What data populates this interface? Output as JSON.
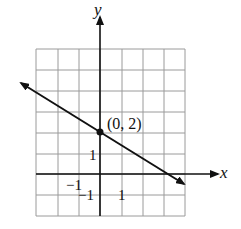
{
  "chart_data": {
    "type": "line",
    "title": "",
    "xlabel": "x",
    "ylabel": "y",
    "xlim": [
      -3,
      4
    ],
    "ylim": [
      -2,
      6
    ],
    "grid": true,
    "grid_spacing": 1,
    "series": [
      {
        "name": "line",
        "x": [
          -3,
          4
        ],
        "y": [
          4,
          -0.67
        ],
        "slope": -0.667,
        "y_intercept": 2,
        "arrows_both_ends": true
      }
    ],
    "annotations": [
      {
        "text": "(0, 2)",
        "x": 0,
        "y": 2,
        "marker": "dot"
      }
    ],
    "tick_labels": {
      "x": [
        {
          "value": -1,
          "text": "−1"
        },
        {
          "value": 1,
          "text": "1"
        }
      ],
      "y": [
        {
          "value": 1,
          "text": "1"
        },
        {
          "value": -1,
          "text": "−1"
        }
      ]
    }
  },
  "labels": {
    "x_axis": "x",
    "y_axis": "y",
    "point": "(0, 2)",
    "y_tick_pos": "1",
    "x_tick_neg": "−1",
    "y_tick_neg": "−1",
    "x_tick_pos": "1"
  },
  "colors": {
    "grid": "#9a9a9a",
    "axis": "#111111",
    "line": "#111111",
    "background": "#ffffff"
  }
}
